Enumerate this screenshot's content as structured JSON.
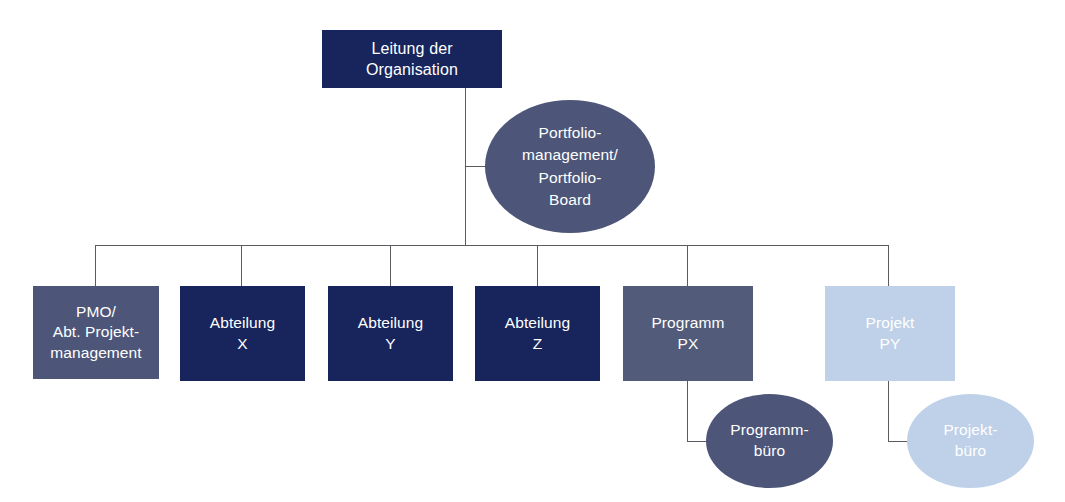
{
  "diagram": {
    "colors": {
      "navy": "#17255c",
      "slate": "#4d5679",
      "slate_alt": "#525b7a",
      "light_blue": "#bed1e8",
      "connector": "#5a5a60",
      "background": "#ffffff",
      "text": "#ffffff"
    },
    "nodes": [
      {
        "id": "leitung",
        "label": "Leitung der\nOrganisation",
        "shape": "box",
        "color": "#17255c",
        "level": 0
      },
      {
        "id": "portfolio",
        "label": "Portfolio-\nmanagement/\nPortfolio-\nBoard",
        "shape": "ellipse",
        "color": "#4d5679",
        "level": 1
      },
      {
        "id": "pmo",
        "label": "PMO/\nAbt. Projekt-\nmanagement",
        "shape": "box",
        "color": "#4d5679",
        "level": 2
      },
      {
        "id": "abteilung-x",
        "label": "Abteilung\nX",
        "shape": "box",
        "color": "#17255c",
        "level": 2
      },
      {
        "id": "abteilung-y",
        "label": "Abteilung\nY",
        "shape": "box",
        "color": "#17255c",
        "level": 2
      },
      {
        "id": "abteilung-z",
        "label": "Abteilung\nZ",
        "shape": "box",
        "color": "#17255c",
        "level": 2
      },
      {
        "id": "programm-px",
        "label": "Programm\nPX",
        "shape": "box",
        "color": "#525b7a",
        "level": 2
      },
      {
        "id": "projekt-py",
        "label": "Projekt\nPY",
        "shape": "box",
        "color": "#bed1e8",
        "level": 2
      },
      {
        "id": "programmbuero",
        "label": "Programm-\nbüro",
        "shape": "ellipse",
        "color": "#4d5679",
        "level": 3
      },
      {
        "id": "projektbuero",
        "label": "Projekt-\nbüro",
        "shape": "ellipse",
        "color": "#bed1e8",
        "level": 3
      }
    ]
  }
}
